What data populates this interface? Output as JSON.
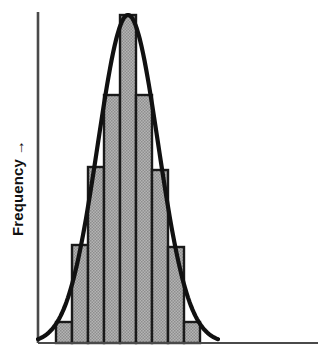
{
  "figure": {
    "name": "histogram-with-normal-curve",
    "background_color": "#ffffff",
    "bar_fill_color": "#a9a9a9",
    "bar_outline_color": "#1a1a1a",
    "curve_color": "#111111",
    "axis_color": "#4a4a4a"
  },
  "axes": {
    "y_axis_label": "Frequency",
    "y_axis_arrow": "→",
    "y_axis_label_name": "y-axis-label",
    "x_axis_label": "",
    "y_axis_x_px": 38,
    "y_axis_top_px": 12,
    "baseline_y_px": 343,
    "x_axis_right_px": 318,
    "plot_left_px": 56,
    "plot_right_px": 200
  },
  "chart_data": {
    "type": "bar",
    "title": "",
    "xlabel": "",
    "ylabel": "Frequency",
    "grid": false,
    "legend": "none",
    "categories": [
      "1",
      "2",
      "3",
      "4",
      "5",
      "6",
      "7",
      "8",
      "9"
    ],
    "values": [
      2,
      8,
      13,
      17,
      21,
      17,
      13,
      8,
      2
    ],
    "ylim": [
      0,
      22
    ],
    "bar_count": 9,
    "bar_tops_px": [
      322,
      245,
      167,
      95,
      15,
      95,
      170,
      247,
      322
    ],
    "bar_edges_px": [
      56,
      72,
      88,
      104,
      120,
      136,
      152,
      168,
      184,
      200
    ],
    "overlay": {
      "type": "line",
      "name": "normal-distribution-curve",
      "label": "",
      "peak_x_px": 128,
      "peak_y_px": 15,
      "left_tail_x_px": 42,
      "right_tail_x_px": 214
    }
  }
}
